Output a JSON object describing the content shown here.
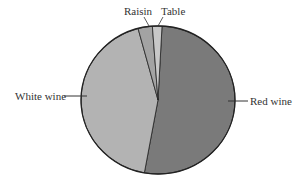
{
  "chart_data": {
    "type": "pie",
    "title": "",
    "categories": [
      "Red wine",
      "White wine",
      "Raisin",
      "Table"
    ],
    "values": [
      52,
      43,
      3,
      2
    ],
    "colors": [
      "#7a7a7a",
      "#b3b3b3",
      "#a3a3a3",
      "#c8c8c8"
    ],
    "legend": "none (callout labels)"
  },
  "labels": {
    "red_wine": "Red wine",
    "white_wine": "White wine",
    "raisin": "Raisin",
    "table": "Table"
  }
}
